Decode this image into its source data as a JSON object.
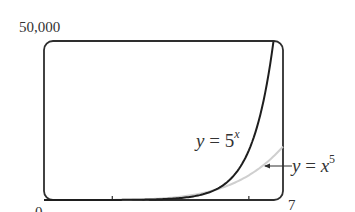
{
  "chart_data": {
    "type": "line",
    "title": "",
    "xlabel": "",
    "ylabel": "",
    "xlim": [
      0,
      7
    ],
    "ylim": [
      0,
      50000
    ],
    "grid": false,
    "axis_labels": {
      "y_max": "50,000",
      "x_min": "0",
      "x_max": "7"
    },
    "x_ticks": [
      2,
      6
    ],
    "series": [
      {
        "name": "y = 5^x",
        "label_lhs": "y",
        "label_eq": " = ",
        "label_base": "5",
        "label_exp": "x",
        "color": "#1e1e1e",
        "x": [
          0,
          1,
          2,
          3,
          4,
          5,
          5.5,
          6,
          6.25,
          6.5,
          6.72
        ],
        "y": [
          1,
          5,
          25,
          125,
          625,
          3125,
          6988,
          15625,
          23364,
          34939,
          50000
        ]
      },
      {
        "name": "y = x^5",
        "label_lhs": "y",
        "label_eq": " = ",
        "label_base": "x",
        "label_exp": "5",
        "color": "#cfcfcf",
        "x": [
          0,
          1,
          2,
          3,
          4,
          5,
          6,
          7
        ],
        "y": [
          0,
          1,
          32,
          243,
          1024,
          3125,
          7776,
          16807
        ]
      }
    ],
    "annotations": [
      {
        "text": "y = 5^x",
        "target": "y = 5^x",
        "position": "left of curve near x≈6.3"
      },
      {
        "text": "y = x^5",
        "target": "y = x^5",
        "arrow": true,
        "position": "right of plot, arrow pointing left to curve near x≈6.6"
      }
    ]
  }
}
